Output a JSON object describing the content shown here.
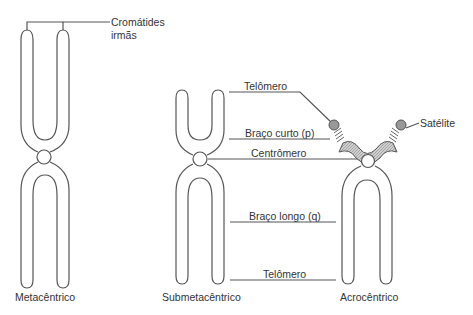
{
  "diagram": {
    "chromosomes": [
      {
        "type": "metacentric",
        "label": "Metacêntrico"
      },
      {
        "type": "submetacentric",
        "label": "Submetacêntrico"
      },
      {
        "type": "acrocentric",
        "label": "Acrocêntrico"
      }
    ],
    "annotations": {
      "sister_chromatids_line1": "Cromátides",
      "sister_chromatids_line2": "irmãs",
      "telomere_top": "Telômero",
      "short_arm": "Braço curto (p)",
      "centromere": "Centrômero",
      "satellite": "Satélite",
      "long_arm": "Braço longo (q)",
      "telomere_bottom": "Telômero"
    },
    "colors": {
      "stroke": "#555555",
      "satellite_fill": "#9a9a9a",
      "short_arm_fill": "#b5b5b5"
    }
  }
}
